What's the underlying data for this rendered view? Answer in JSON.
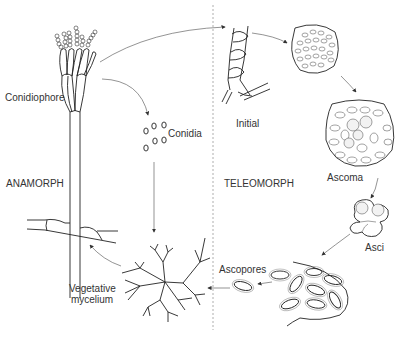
{
  "diagram": {
    "type": "life-cycle",
    "regions": [
      {
        "id": "anamorph",
        "label": "ANAMORPH"
      },
      {
        "id": "teleomorph",
        "label": "TELEOMORPH"
      }
    ],
    "nodes": {
      "conidiophore": "Conidiophore",
      "conidia": "Conidia",
      "vegetative_mycelium_line1": "Vegetative",
      "vegetative_mycelium_line2": "mycelium",
      "initial": "Initial",
      "ascoma": "Ascoma",
      "asci": "Asci",
      "ascopores": "Ascopores"
    },
    "edges": [
      {
        "from": "Conidiophore",
        "to": "Initial"
      },
      {
        "from": "Conidiophore",
        "to": "Conidia"
      },
      {
        "from": "Conidia",
        "to": "Vegetative mycelium"
      },
      {
        "from": "Vegetative mycelium",
        "to": "Conidiophore"
      },
      {
        "from": "Initial",
        "to": "Young ascoma"
      },
      {
        "from": "Young ascoma",
        "to": "Ascoma"
      },
      {
        "from": "Ascoma",
        "to": "Asci"
      },
      {
        "from": "Asci",
        "to": "Ascospores"
      },
      {
        "from": "Ascospores",
        "to": "Ascopores"
      },
      {
        "from": "Ascopores",
        "to": "Vegetative mycelium"
      }
    ],
    "colors": {
      "line": "#222222",
      "arrow": "#666666",
      "divider": "#999999",
      "text": "#333333",
      "background": "#ffffff"
    }
  }
}
